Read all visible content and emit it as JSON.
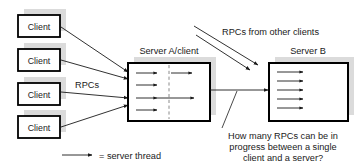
{
  "figure": {
    "background": "#ffffff",
    "ink": "#1a1a1a",
    "shadow_color": "#cfcfcf",
    "dashed_divider_color": "#8a8a8a"
  },
  "clients": [
    {
      "label": "Client"
    },
    {
      "label": "Client"
    },
    {
      "label": "Client"
    },
    {
      "label": "Client"
    }
  ],
  "servers": {
    "a": {
      "label": "Server A/client",
      "thread_rows": 4,
      "threads_crossing_divider": 3,
      "has_dashed_divider": true
    },
    "b": {
      "label": "Server B",
      "thread_rows": 5,
      "has_dashed_divider": false
    }
  },
  "labels": {
    "rpcs": "RPCs",
    "rpcs_other_clients": "RPCs from other clients"
  },
  "annotation": {
    "lines": [
      "How many RPCs can be in",
      "progress between a single",
      "client and a server?"
    ]
  },
  "legend": {
    "text": "= server thread",
    "icon": "arrow-right-icon"
  }
}
